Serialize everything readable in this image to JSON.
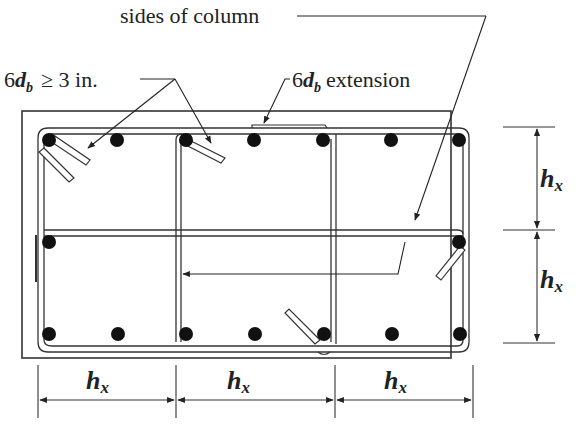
{
  "labels": {
    "sides_of_column": "sides of column",
    "hook_prefix": "6",
    "hook_d": "d",
    "hook_b": "b",
    "hook_suffix": "≥ 3 in.",
    "ext_prefix": "6",
    "ext_d": "d",
    "ext_b": "b",
    "ext_suffix": "extension"
  },
  "dimensions": {
    "horizontal": [
      {
        "h": "h",
        "sub": "x"
      },
      {
        "h": "h",
        "sub": "x"
      },
      {
        "h": "h",
        "sub": "x"
      }
    ],
    "vertical": [
      {
        "h": "h",
        "sub": "x"
      },
      {
        "h": "h",
        "sub": "x"
      }
    ]
  },
  "colors": {
    "line": "#333333",
    "bar": "#111111",
    "background": "#ffffff"
  }
}
